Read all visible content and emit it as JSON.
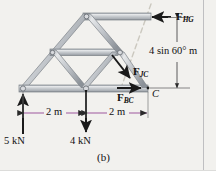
{
  "figure": {
    "caption": "(b)",
    "background_color": "#f2f1ee",
    "border_color": "#b9b9bb",
    "member_color": "#b8bcc2",
    "member_edge_color": "#7d8288",
    "dimension_color": "#b07ab0",
    "arrow_color": "#1a1a1a",
    "section_line_color": "#c9c6bd"
  },
  "forces": {
    "hg": {
      "name": "F",
      "subscript": "HG",
      "direction": "left"
    },
    "jc": {
      "name": "F",
      "subscript": "JC",
      "direction": "down-right"
    },
    "bc": {
      "name": "F",
      "subscript": "BC",
      "direction": "right"
    }
  },
  "loads": [
    {
      "label": "5 kN",
      "direction": "up"
    },
    {
      "label": "4 kN",
      "direction": "down"
    }
  ],
  "dimensions": {
    "span_left": "2 m",
    "span_right": "2 m",
    "height": "4 sin 60° m"
  },
  "points": {
    "c": "C"
  }
}
